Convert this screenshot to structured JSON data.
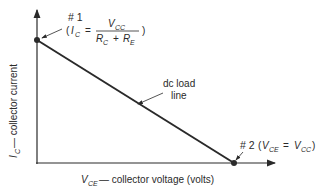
{
  "diagram": {
    "title": "DC load line",
    "y_axis_label": {
      "symbol": "I",
      "subscript": "C",
      "text": " — collector current"
    },
    "x_axis_label": {
      "symbol": "V",
      "subscript": "CE",
      "text": " — collector voltage (volts)"
    },
    "point1": {
      "id": "# 1",
      "lhs_symbol": "I",
      "lhs_sub": "C",
      "numerator_symbol": "V",
      "numerator_sub": "CC",
      "denominator_a_symbol": "R",
      "denominator_a_sub": "C",
      "plus": "+",
      "denominator_b_symbol": "R",
      "denominator_b_sub": "E",
      "open_paren": "(",
      "close_paren": ")",
      "equals": "="
    },
    "point2": {
      "id": "# 2",
      "lhs_symbol": "V",
      "lhs_sub": "CE",
      "rhs_symbol": "V",
      "rhs_sub": "CC",
      "open_paren": "(",
      "close_paren": ")",
      "equals": "="
    },
    "load_line_label": {
      "line1": "dc load",
      "line2": "line"
    },
    "colors": {
      "ink": "#2a2a2a",
      "background": "#ffffff"
    }
  }
}
